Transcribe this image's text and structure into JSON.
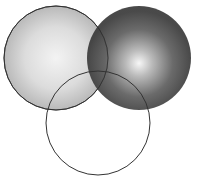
{
  "diagram": {
    "type": "venn",
    "width": 204,
    "height": 188,
    "background": "#ffffff",
    "stroke_color": "#3a3a3a",
    "circles": [
      {
        "id": "left",
        "cx": 56,
        "cy": 58,
        "r": 52,
        "fill": "light-gray-radial",
        "center_color": "#f2f2f2",
        "edge_color": "#bdbdbd"
      },
      {
        "id": "right",
        "cx": 139,
        "cy": 58,
        "r": 52,
        "fill": "dark-gray-radial",
        "center_color": "#f4f4f4",
        "edge_color": "#3c3c3c"
      },
      {
        "id": "bottom",
        "cx": 98,
        "cy": 123,
        "r": 52,
        "fill": "none"
      }
    ]
  }
}
